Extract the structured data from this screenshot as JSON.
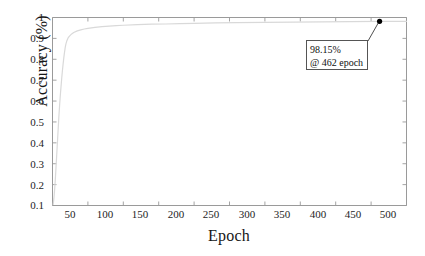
{
  "chart_data": {
    "type": "line",
    "title": "",
    "xlabel": "Epoch",
    "ylabel": "Accuracy (%)",
    "xlim": [
      0,
      500
    ],
    "ylim": [
      0.1,
      1.0
    ],
    "grid": false,
    "legend": "none",
    "xticks": [
      "50",
      "100",
      "150",
      "200",
      "250",
      "300",
      "350",
      "400",
      "450",
      "500"
    ],
    "xtick_values": [
      50,
      100,
      150,
      200,
      250,
      300,
      350,
      400,
      450,
      500
    ],
    "yticks": [
      "0.1",
      "0.2",
      "0.3",
      "0.4",
      "0.5",
      "0.6",
      "0.7",
      "0.8",
      "0.9",
      "1"
    ],
    "ytick_values": [
      0.1,
      0.2,
      0.3,
      0.4,
      0.5,
      0.6,
      0.7,
      0.8,
      0.9,
      1.0
    ],
    "series": [
      {
        "name": "Accuracy",
        "color": "#d9d9d9",
        "x": [
          1,
          2,
          3,
          4,
          5,
          6,
          7,
          8,
          9,
          10,
          11,
          12,
          13,
          14,
          15,
          16,
          17,
          18,
          19,
          20,
          22,
          24,
          26,
          28,
          30,
          35,
          40,
          45,
          50,
          60,
          70,
          80,
          90,
          100,
          120,
          140,
          160,
          180,
          200,
          230,
          260,
          300,
          340,
          380,
          420,
          462,
          500
        ],
        "values": [
          0.105,
          0.135,
          0.175,
          0.225,
          0.285,
          0.345,
          0.405,
          0.465,
          0.525,
          0.578,
          0.625,
          0.668,
          0.708,
          0.745,
          0.778,
          0.808,
          0.834,
          0.857,
          0.874,
          0.886,
          0.902,
          0.911,
          0.918,
          0.923,
          0.928,
          0.936,
          0.941,
          0.945,
          0.948,
          0.953,
          0.956,
          0.959,
          0.961,
          0.963,
          0.966,
          0.968,
          0.969,
          0.971,
          0.972,
          0.974,
          0.975,
          0.977,
          0.978,
          0.979,
          0.98,
          0.9815,
          0.9815
        ]
      }
    ],
    "annotations": [
      {
        "name": "peak-accuracy",
        "line1": "98.15%",
        "line2": "@ 462 epoch",
        "point_x": 462,
        "point_y": 0.9815,
        "marker_color": "#000000"
      }
    ],
    "axis_color": "#9a9a9a"
  }
}
